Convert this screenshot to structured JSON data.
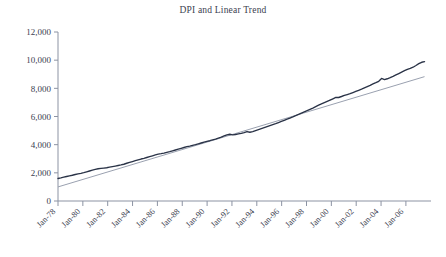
{
  "chart_data": {
    "type": "line",
    "title": "DPI and Linear Trend",
    "xlabel": "",
    "ylabel": "",
    "grid": false,
    "legend": "none",
    "ylim": [
      0,
      12000
    ],
    "ytick_labels": [
      "0",
      "2,000",
      "4,000",
      "6,000",
      "8,000",
      "10,000",
      "12,000"
    ],
    "ytick_values": [
      0,
      2000,
      4000,
      6000,
      8000,
      10000,
      12000
    ],
    "categories": [
      "Jan-78",
      "Jan-80",
      "Jan-82",
      "Jan-84",
      "Jan-86",
      "Jan-88",
      "Jan-90",
      "Jan-92",
      "Jan-94",
      "Jan-96",
      "Jan-98",
      "Jan-00",
      "Jan-02",
      "Jan-04",
      "Jan-06"
    ],
    "x": [
      1978,
      1980,
      1982,
      1984,
      1986,
      1988,
      1990,
      1992,
      1994,
      1996,
      1998,
      2000,
      2002,
      2004,
      2006
    ],
    "series": [
      {
        "name": "DPI",
        "color": "#2a3347",
        "values": [
          1600,
          1960,
          2320,
          2560,
          2980,
          3360,
          3820,
          4280,
          4760,
          5420,
          6080,
          6900,
          7540,
          8450,
          9480
        ]
      },
      {
        "name": "Linear Trend",
        "color": "#9aa1b0",
        "values": [
          1000,
          1540,
          2080,
          2620,
          3160,
          3700,
          4240,
          4780,
          5320,
          5860,
          6400,
          6940,
          7480,
          8020,
          8560
        ]
      }
    ],
    "dpi_monthly": [
      1600,
      1640,
      1690,
      1740,
      1790,
      1830,
      1880,
      1920,
      1960,
      2010,
      2070,
      2130,
      2190,
      2250,
      2290,
      2320,
      2340,
      2360,
      2400,
      2440,
      2480,
      2520,
      2560,
      2610,
      2680,
      2740,
      2800,
      2860,
      2920,
      2980,
      3030,
      3090,
      3150,
      3210,
      3270,
      3330,
      3360,
      3400,
      3450,
      3500,
      3560,
      3620,
      3680,
      3740,
      3800,
      3860,
      3900,
      3950,
      4000,
      4060,
      4120,
      4180,
      4230,
      4280,
      4340,
      4400,
      4470,
      4540,
      4620,
      4700,
      4740,
      4700,
      4720,
      4760,
      4800,
      4860,
      4930,
      4880,
      4930,
      5000,
      5070,
      5140,
      5210,
      5280,
      5350,
      5420,
      5490,
      5570,
      5650,
      5730,
      5810,
      5890,
      5970,
      6060,
      6150,
      6240,
      6330,
      6420,
      6510,
      6600,
      6700,
      6800,
      6900,
      6990,
      7080,
      7170,
      7260,
      7350,
      7350,
      7420,
      7500,
      7560,
      7620,
      7700,
      7780,
      7860,
      7940,
      8030,
      8120,
      8210,
      8310,
      8400,
      8500,
      8700,
      8620,
      8680,
      8760,
      8850,
      8950,
      9050,
      9150,
      9250,
      9350,
      9420,
      9500,
      9620,
      9750,
      9850,
      9900
    ]
  }
}
